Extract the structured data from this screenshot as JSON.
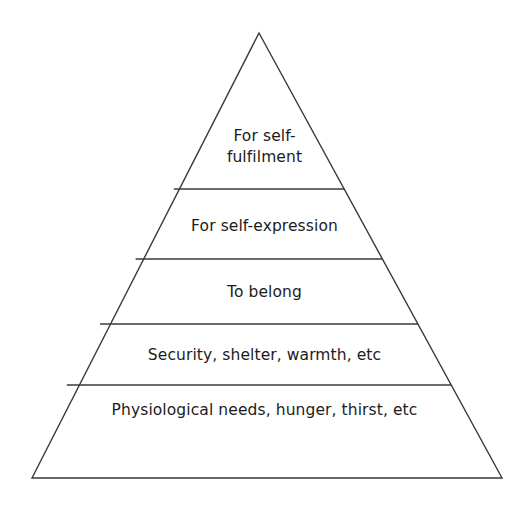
{
  "figure": {
    "type": "pyramid-hierarchy",
    "background_color": "#ffffff",
    "stroke_color": "#3a3a3a",
    "text_color": "#1c1c1c",
    "apex": {
      "x": 259,
      "y": 33
    },
    "base_left": {
      "x": 32,
      "y": 478
    },
    "base_right": {
      "x": 502,
      "y": 478
    },
    "divider_y": [
      189,
      259,
      324,
      385
    ]
  },
  "tiers": [
    {
      "index": 0,
      "level": "top",
      "label": "For self-\nfulfilment",
      "label_line_1": "For self-",
      "label_line_2": "fulfilment"
    },
    {
      "index": 1,
      "level": "second",
      "label": "For self-expression"
    },
    {
      "index": 2,
      "level": "third",
      "label": "To belong"
    },
    {
      "index": 3,
      "level": "fourth",
      "label": "Security, shelter, warmth, etc"
    },
    {
      "index": 4,
      "level": "base",
      "label": "Physiological needs, hunger, thirst, etc"
    }
  ]
}
